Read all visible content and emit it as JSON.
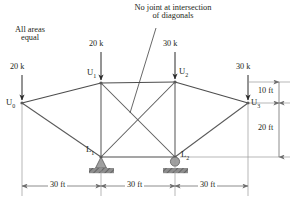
{
  "figure": {
    "note_line1": "No joint at intersection",
    "note_line2": "of diagonals",
    "areas_line1": "All areas",
    "areas_line2": "equal"
  },
  "joints": [
    {
      "id": "U0",
      "label": "U",
      "sub": "0",
      "x": 22,
      "y": 103
    },
    {
      "id": "U1",
      "label": "U",
      "sub": "1",
      "x": 101,
      "y": 83
    },
    {
      "id": "U2",
      "label": "U",
      "sub": "2",
      "x": 175,
      "y": 82
    },
    {
      "id": "U3",
      "label": "U",
      "sub": "3",
      "x": 248,
      "y": 103
    },
    {
      "id": "L1",
      "label": "L",
      "sub": "1",
      "x": 101,
      "y": 157
    },
    {
      "id": "L2",
      "label": "L",
      "sub": "2",
      "x": 175,
      "y": 157
    }
  ],
  "members": [
    {
      "from": "U0",
      "to": "U1",
      "kind": "top-chord"
    },
    {
      "from": "U1",
      "to": "U2",
      "kind": "top-chord"
    },
    {
      "from": "U2",
      "to": "U3",
      "kind": "top-chord"
    },
    {
      "from": "U0",
      "to": "L1",
      "kind": "diagonal"
    },
    {
      "from": "L1",
      "to": "L2",
      "kind": "bottom-chord"
    },
    {
      "from": "L2",
      "to": "U3",
      "kind": "diagonal"
    },
    {
      "from": "U1",
      "to": "L1",
      "kind": "vertical"
    },
    {
      "from": "U2",
      "to": "L2",
      "kind": "vertical"
    },
    {
      "from": "U1",
      "to": "L2",
      "kind": "diagonal-brace"
    },
    {
      "from": "U2",
      "to": "L1",
      "kind": "diagonal-brace"
    }
  ],
  "loads": [
    {
      "at": "U0",
      "value": "20 k",
      "direction": "down"
    },
    {
      "at": "U1",
      "value": "20 k",
      "direction": "down"
    },
    {
      "at": "U2",
      "value": "30 k",
      "direction": "down"
    },
    {
      "at": "U3",
      "value": "30 k",
      "direction": "down"
    }
  ],
  "supports": [
    {
      "at": "L1",
      "type": "pin"
    },
    {
      "at": "L2",
      "type": "roller"
    }
  ],
  "dimensions": {
    "horizontal": [
      "30 ft",
      "30 ft",
      "30 ft"
    ],
    "vertical": [
      "10 ft",
      "20 ft"
    ]
  },
  "colors": {
    "member": "#5a5a5a",
    "arrow": "#2b2b2b",
    "dim": "#6e6e6e",
    "support": "#a0a0a0",
    "text": "#231f20"
  }
}
